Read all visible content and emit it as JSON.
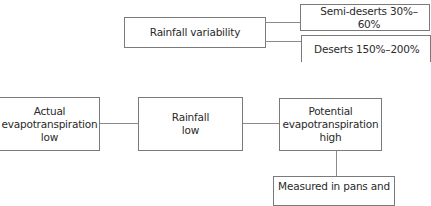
{
  "diagram": {
    "nodes": {
      "rainfall_variability": {
        "label": "Rainfall variability"
      },
      "semi_deserts": {
        "label": "Semi-deserts 30%–60%"
      },
      "deserts": {
        "label": "Deserts 150%–200%"
      },
      "actual_evapotranspiration": {
        "label": "Actual\nevapotranspiration\nlow"
      },
      "rainfall_low": {
        "label": "Rainfall\nlow"
      },
      "potential_evapotranspiration": {
        "label": "Potential\nevapotranspiration\nhigh"
      },
      "measured": {
        "label": "Measured in pans and"
      }
    },
    "edges": [
      {
        "from": "rainfall_variability",
        "to": "semi_deserts"
      },
      {
        "from": "rainfall_variability",
        "to": "deserts"
      },
      {
        "from": "actual_evapotranspiration",
        "to": "rainfall_low"
      },
      {
        "from": "rainfall_low",
        "to": "potential_evapotranspiration"
      },
      {
        "from": "potential_evapotranspiration",
        "to": "measured"
      }
    ]
  }
}
